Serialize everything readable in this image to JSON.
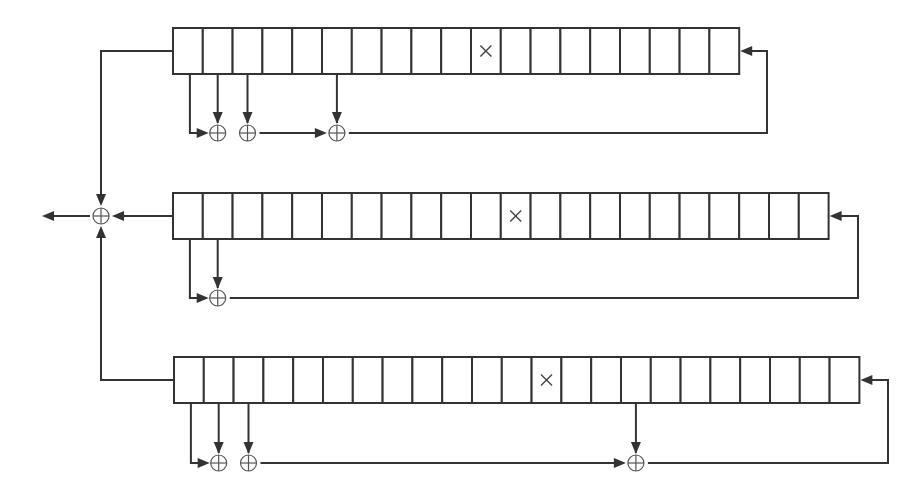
{
  "diagram": {
    "colors": {
      "line": "#333333",
      "background": "#ffffff"
    },
    "cell_width": 29.8,
    "cell_height": 46,
    "output": {
      "xor": {
        "x": 101,
        "y": 216
      },
      "output_arrow_tip_x": 42
    },
    "registers": [
      {
        "name": "register-1",
        "x": 173,
        "y": 28,
        "cells": 19,
        "marked_cell": 10,
        "mark_symbol": "×",
        "tap_cells": [
          1,
          2,
          5
        ],
        "feedback_x": 767,
        "xor_y": 133,
        "output_connector": {
          "y": 51,
          "direction": "down"
        }
      },
      {
        "name": "register-2",
        "x": 173,
        "y": 193,
        "cells": 22,
        "marked_cell": 11,
        "mark_symbol": "×",
        "tap_cells": [
          1
        ],
        "feedback_x": 858,
        "xor_y": 298,
        "output_connector": {
          "y": 216,
          "direction": "left"
        }
      },
      {
        "name": "register-3",
        "x": 174,
        "y": 357,
        "cells": 23,
        "marked_cell": 12,
        "mark_symbol": "×",
        "tap_cells": [
          1,
          2,
          15
        ],
        "feedback_x": 888,
        "xor_y": 463,
        "output_connector": {
          "y": 380,
          "direction": "up"
        }
      }
    ]
  }
}
